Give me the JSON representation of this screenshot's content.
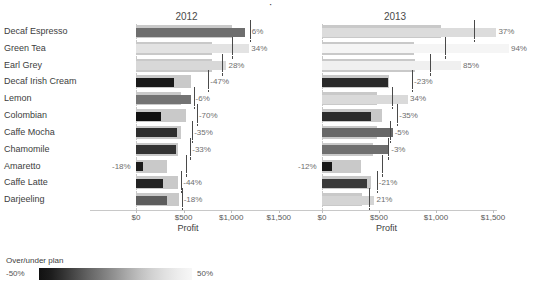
{
  "title_sliver": "·",
  "axis": {
    "xlabel": "Profit",
    "ticks": [
      {
        "value": 0,
        "label": "$0"
      },
      {
        "value": 500,
        "label": "$500"
      },
      {
        "value": 1000,
        "label": "$1,000"
      },
      {
        "value": 1500,
        "label": "$1,500"
      }
    ],
    "xmin": -200,
    "xmax": 1650
  },
  "panels": [
    {
      "key": "2012",
      "label": "2012"
    },
    {
      "key": "2013",
      "label": "2013"
    }
  ],
  "legend": {
    "title": "Over/under plan",
    "min_label": "-50%",
    "max_label": "50%",
    "min_color": "#111111",
    "max_color": "#f7f7f7"
  },
  "chart_data": {
    "type": "bar",
    "chart_style": "bullet-graph small multiples",
    "title": "",
    "xlabel": "Profit",
    "ylabel": "",
    "xlim": [
      -200,
      1650
    ],
    "grid": false,
    "legend_position": "bottom-left",
    "categories": [
      "Decaf Espresso",
      "Green Tea",
      "Earl Grey",
      "Decaf Irish Cream",
      "Lemon",
      "Colombian",
      "Caffe Mocha",
      "Chamomile",
      "Amaretto",
      "Caffe Latte",
      "Darjeeling"
    ],
    "encodings": {
      "plan_band": "light gray reference band = plan",
      "value_bar": "bar length = Profit, bar color = over/under plan %",
      "target_tick": "vertical dark line = target profit",
      "data_label": "over/under plan percent"
    },
    "panels": [
      {
        "name": "2012",
        "rows": [
          {
            "category": "Decaf Espresso",
            "profit": 1150,
            "plan": 1010,
            "target": 1195,
            "pct_label": "6%",
            "pct": 6,
            "bar_color": "#6e6e6e"
          },
          {
            "category": "Green Tea",
            "profit": 1190,
            "plan": 800,
            "target": 1005,
            "pct_label": "34%",
            "pct": 34,
            "bar_color": "#e3e3e3"
          },
          {
            "category": "Earl Grey",
            "profit": 950,
            "plan": 800,
            "target": 905,
            "pct_label": "28%",
            "pct": 28,
            "bar_color": "#d8d8d8"
          },
          {
            "category": "Decaf Irish Cream",
            "profit": 400,
            "plan": 580,
            "target": 760,
            "pct_label": "-47%",
            "pct": -47,
            "bar_color": "#1a1a1a"
          },
          {
            "category": "Lemon",
            "profit": 580,
            "plan": 470,
            "target": 605,
            "pct_label": "-6%",
            "pct": -6,
            "bar_color": "#737373"
          },
          {
            "category": "Colombian",
            "profit": 265,
            "plan": 520,
            "target": 640,
            "pct_label": "-70%",
            "pct": -70,
            "bar_color": "#111111"
          },
          {
            "category": "Caffe Mocha",
            "profit": 435,
            "plan": 470,
            "target": 590,
            "pct_label": "-35%",
            "pct": -35,
            "bar_color": "#2e2e2e"
          },
          {
            "category": "Chamomile",
            "profit": 420,
            "plan": 440,
            "target": 570,
            "pct_label": "-33%",
            "pct": -33,
            "bar_color": "#333333"
          },
          {
            "category": "Amaretto",
            "profit": 70,
            "plan": 330,
            "target": 520,
            "pct_label": "-18%",
            "pct": -18,
            "bar_color": "#1c1c1c"
          },
          {
            "category": "Caffe Latte",
            "profit": 280,
            "plan": 440,
            "target": 475,
            "pct_label": "-44%",
            "pct": -44,
            "bar_color": "#222222"
          },
          {
            "category": "Darjeeling",
            "profit": 330,
            "plan": 450,
            "target": 480,
            "pct_label": "-18%",
            "pct": -18,
            "bar_color": "#5c5c5c"
          }
        ]
      },
      {
        "name": "2013",
        "rows": [
          {
            "category": "Decaf Espresso",
            "profit": 1530,
            "plan": 1045,
            "target": 1330,
            "pct_label": "37%",
            "pct": 37,
            "bar_color": "#dcdcdc"
          },
          {
            "category": "Green Tea",
            "profit": 1640,
            "plan": 810,
            "target": 1075,
            "pct_label": "94%",
            "pct": 94,
            "bar_color": "#f5f5f5"
          },
          {
            "category": "Earl Grey",
            "profit": 1220,
            "plan": 820,
            "target": 950,
            "pct_label": "85%",
            "pct": 85,
            "bar_color": "#f0f0f0"
          },
          {
            "category": "Decaf Irish Cream",
            "profit": 580,
            "plan": 585,
            "target": 790,
            "pct_label": "-23%",
            "pct": -23,
            "bar_color": "#2a2a2a"
          },
          {
            "category": "Lemon",
            "profit": 755,
            "plan": 480,
            "target": 615,
            "pct_label": "34%",
            "pct": 34,
            "bar_color": "#dadada"
          },
          {
            "category": "Colombian",
            "profit": 430,
            "plan": 530,
            "target": 660,
            "pct_label": "-35%",
            "pct": -35,
            "bar_color": "#2b2b2b"
          },
          {
            "category": "Caffe Mocha",
            "profit": 620,
            "plan": 480,
            "target": 600,
            "pct_label": "-5%",
            "pct": -5,
            "bar_color": "#686868"
          },
          {
            "category": "Chamomile",
            "profit": 590,
            "plan": 450,
            "target": 575,
            "pct_label": "-3%",
            "pct": -3,
            "bar_color": "#6f6f6f"
          },
          {
            "category": "Amaretto",
            "profit": 90,
            "plan": 345,
            "target": 530,
            "pct_label": "-12%",
            "pct": -12,
            "bar_color": "#181818"
          },
          {
            "category": "Caffe Latte",
            "profit": 395,
            "plan": 430,
            "target": 480,
            "pct_label": "-21%",
            "pct": -21,
            "bar_color": "#3a3a3a"
          },
          {
            "category": "Darjeeling",
            "profit": 460,
            "plan": 350,
            "target": 415,
            "pct_label": "21%",
            "pct": 21,
            "bar_color": "#d4d4d4"
          }
        ]
      }
    ]
  }
}
